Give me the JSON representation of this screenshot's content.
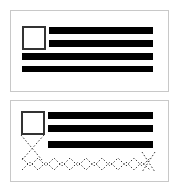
{
  "diagram": {
    "colors": {
      "bar": "#000000",
      "border": "#c8c8c8",
      "box_border": "#333333",
      "dots": "#333333"
    },
    "panels": [
      {
        "name": "top-panel",
        "box": {
          "x": 22,
          "y": 26,
          "w": 24,
          "h": 24
        },
        "bars": [
          {
            "x": 49,
            "y": 27,
            "w": 104,
            "h": 7
          },
          {
            "x": 49,
            "y": 40,
            "w": 104,
            "h": 7
          },
          {
            "x": 22,
            "y": 53,
            "w": 131,
            "h": 7
          },
          {
            "x": 22,
            "y": 66,
            "w": 131,
            "h": 6
          }
        ]
      },
      {
        "name": "bottom-panel",
        "box": {
          "x": 21,
          "y": 111,
          "w": 24,
          "h": 24
        },
        "bars": [
          {
            "x": 48,
            "y": 112,
            "w": 105,
            "h": 7
          },
          {
            "x": 48,
            "y": 125,
            "w": 105,
            "h": 7
          },
          {
            "x": 48,
            "y": 141,
            "w": 105,
            "h": 7
          }
        ],
        "dotted_pattern": "crossed diamond chain below box"
      }
    ]
  }
}
